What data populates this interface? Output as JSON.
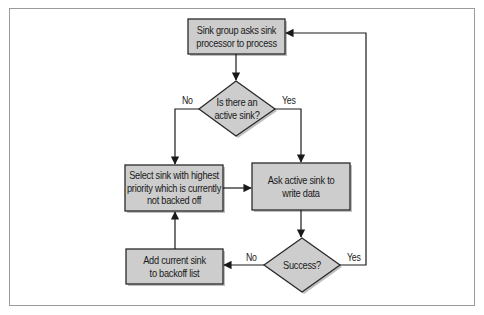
{
  "diagram": {
    "type": "flowchart",
    "colors": {
      "node_fill": "#cdcdcd",
      "node_stroke": "#2a2a2a",
      "shadow": "#8c8c8c",
      "line": "#1a1a1a",
      "frame_border": "#9a9a9a"
    },
    "nodes": [
      {
        "id": "start",
        "shape": "rect",
        "text_lines": [
          "Sink group asks sink",
          "processor to process"
        ]
      },
      {
        "id": "decision_active",
        "shape": "diamond",
        "text_lines": [
          "Is there an",
          "active sink?"
        ]
      },
      {
        "id": "select",
        "shape": "rect",
        "text_lines": [
          "Select sink with highest",
          "priority which is currently",
          "not backed off"
        ]
      },
      {
        "id": "ask",
        "shape": "rect",
        "text_lines": [
          "Ask active sink to",
          "write data"
        ]
      },
      {
        "id": "decision_success",
        "shape": "diamond",
        "text_lines": [
          "Success?"
        ]
      },
      {
        "id": "backoff",
        "shape": "rect",
        "text_lines": [
          "Add current sink",
          "to backoff list"
        ]
      }
    ],
    "edges": [
      {
        "from": "start",
        "to": "decision_active",
        "label": ""
      },
      {
        "from": "decision_active",
        "to": "select",
        "label": "No"
      },
      {
        "from": "decision_active",
        "to": "ask",
        "label": "Yes"
      },
      {
        "from": "select",
        "to": "ask",
        "label": ""
      },
      {
        "from": "ask",
        "to": "decision_success",
        "label": ""
      },
      {
        "from": "decision_success",
        "to": "backoff",
        "label": "No"
      },
      {
        "from": "decision_success",
        "to": "start",
        "label": "Yes"
      },
      {
        "from": "backoff",
        "to": "select",
        "label": ""
      }
    ],
    "text": {
      "start": "Sink group asks sink processor to process",
      "decision_active": "Is there an active sink?",
      "select": "Select sink with highest priority which is currently not backed off",
      "ask": "Ask active sink to write data",
      "decision_success": "Success?",
      "backoff": "Add current sink to backoff list"
    },
    "labels": {
      "active_no": "No",
      "active_yes": "Yes",
      "success_no": "No",
      "success_yes": "Yes"
    }
  }
}
